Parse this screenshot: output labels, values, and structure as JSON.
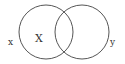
{
  "diagram": {
    "type": "venn",
    "circles": [
      {
        "name": "left",
        "cx": 46,
        "cy": 32,
        "r": 27
      },
      {
        "name": "right",
        "cx": 82,
        "cy": 32,
        "r": 27
      }
    ],
    "labels": {
      "outer_left": "x",
      "inner_left": "X",
      "outer_right": "y"
    },
    "colors": {
      "stroke": "#555555",
      "text": "#333333",
      "background": "#ffffff"
    }
  }
}
